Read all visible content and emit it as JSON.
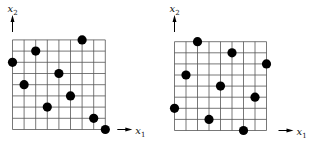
{
  "chart_data": [
    {
      "type": "scatter",
      "title": "",
      "panel": "left",
      "grid": {
        "columns": 8,
        "rows": 8
      },
      "xlabel": "x1",
      "ylabel": "x2",
      "points": [
        {
          "x": 6,
          "y": 8
        },
        {
          "x": 2,
          "y": 7
        },
        {
          "x": 0,
          "y": 6
        },
        {
          "x": 4,
          "y": 5
        },
        {
          "x": 1,
          "y": 4
        },
        {
          "x": 5,
          "y": 3
        },
        {
          "x": 3,
          "y": 2
        },
        {
          "x": 7,
          "y": 1
        },
        {
          "x": 8,
          "y": 0
        }
      ]
    },
    {
      "type": "scatter",
      "title": "",
      "panel": "right",
      "grid": {
        "columns": 8,
        "rows": 8
      },
      "xlabel": "x1",
      "ylabel": "x2",
      "points": [
        {
          "x": 2,
          "y": 8
        },
        {
          "x": 5,
          "y": 7
        },
        {
          "x": 8,
          "y": 6
        },
        {
          "x": 1,
          "y": 5
        },
        {
          "x": 4,
          "y": 4
        },
        {
          "x": 7,
          "y": 3
        },
        {
          "x": 0,
          "y": 2
        },
        {
          "x": 3,
          "y": 1
        },
        {
          "x": 6,
          "y": 0
        }
      ]
    }
  ],
  "labels": {
    "x_main": "x",
    "x_sub": "1",
    "y_main": "x",
    "y_sub": "2"
  },
  "layout": {
    "panels": [
      {
        "ox": 12.5,
        "oy": 129.5,
        "w": 92.8,
        "h": 89.6,
        "yArrowX": 12.5,
        "xArrowY": 129.5
      },
      {
        "ox": 174.5,
        "oy": 130.5,
        "w": 92.0,
        "h": 88.8,
        "yArrowX": 174.5,
        "xArrowY": 130.5
      }
    ]
  }
}
